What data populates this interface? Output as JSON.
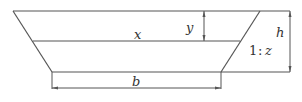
{
  "diagram": {
    "type": "trapezoidal-channel-cross-section",
    "labels": {
      "water_level": "x",
      "depth_y": "y",
      "total_height": "h",
      "slope_ratio_one": "1",
      "slope_ratio_sep": ":",
      "slope_ratio_z": "z",
      "bottom_width": "b"
    },
    "colors": {
      "line": "#555555",
      "text": "#333333",
      "background": "#ffffff"
    }
  }
}
